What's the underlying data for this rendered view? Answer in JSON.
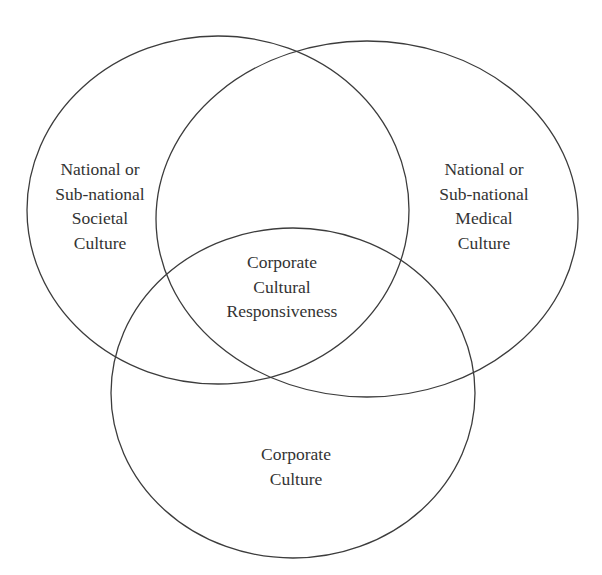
{
  "diagram": {
    "type": "venn",
    "background": "#ffffff",
    "stroke_color": "#3c3c3c",
    "text_color": "#333333",
    "sets": [
      {
        "id": "societal",
        "label_lines": [
          "National or",
          "Sub-national",
          "Societal",
          "Culture"
        ]
      },
      {
        "id": "medical",
        "label_lines": [
          "National or",
          "Sub-national",
          "Medical",
          "Culture"
        ]
      },
      {
        "id": "corporate",
        "label_lines": [
          "Corporate",
          "Culture"
        ]
      }
    ],
    "intersection": {
      "label_lines": [
        "Corporate",
        "Cultural",
        "Responsiveness"
      ]
    }
  }
}
